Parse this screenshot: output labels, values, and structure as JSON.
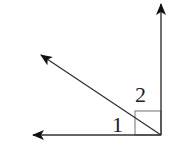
{
  "diagram": {
    "colors": {
      "line": "#333333",
      "right_angle_mark": "#8a8a8a",
      "background": "#ffffff"
    },
    "vertex": {
      "x": 161,
      "y": 135
    },
    "rays": [
      {
        "name": "vertical-ray",
        "end": {
          "x": 161,
          "y": 3
        }
      },
      {
        "name": "diagonal-ray",
        "end": {
          "x": 40,
          "y": 54
        }
      },
      {
        "name": "horizontal-ray",
        "end": {
          "x": 32,
          "y": 135
        }
      }
    ],
    "right_angle_marker": {
      "x": 135,
      "y": 111,
      "size": 26
    },
    "labels": {
      "angle1": "1",
      "angle2": "2"
    }
  }
}
